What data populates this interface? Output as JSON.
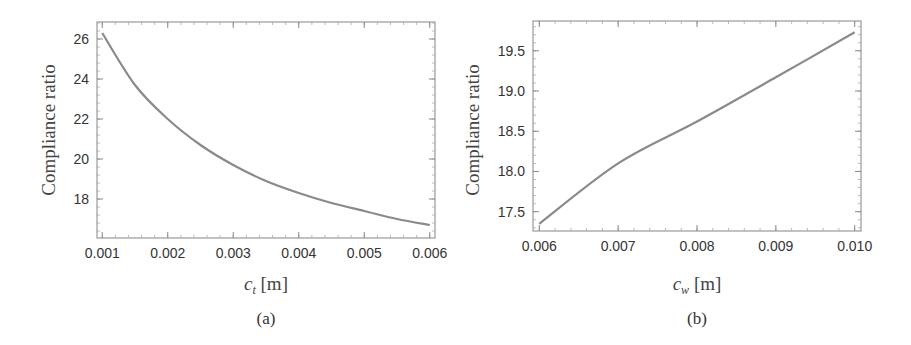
{
  "chart_data": [
    {
      "type": "line",
      "panel": "(a)",
      "title": "",
      "xlabel": "c_t [m]",
      "xlabel_var": "c",
      "xlabel_sub": "t",
      "xlabel_unit": " [m]",
      "ylabel": "Compliance ratio",
      "xlim": [
        0.00092,
        0.00608
      ],
      "ylim": [
        16.05,
        26.85
      ],
      "xticks": [
        "0.001",
        "0.002",
        "0.003",
        "0.004",
        "0.005",
        "0.006"
      ],
      "yticks": [
        "18",
        "20",
        "22",
        "24",
        "26"
      ],
      "grid": false,
      "line_color": "#8a8a8a",
      "x": [
        0.001,
        0.0015,
        0.002,
        0.0025,
        0.003,
        0.0035,
        0.004,
        0.0045,
        0.005,
        0.0055,
        0.006
      ],
      "series": [
        {
          "name": "Compliance ratio",
          "values": [
            26.3,
            23.7,
            22.0,
            20.7,
            19.7,
            18.9,
            18.3,
            17.8,
            17.4,
            17.0,
            16.7
          ]
        }
      ]
    },
    {
      "type": "line",
      "panel": "(b)",
      "title": "",
      "xlabel": "c_w [m]",
      "xlabel_var": "c",
      "xlabel_sub": "w",
      "xlabel_unit": " [m]",
      "ylabel": "Compliance ratio",
      "xlim": [
        0.00592,
        0.01008
      ],
      "ylim": [
        17.26,
        19.87
      ],
      "xticks": [
        "0.006",
        "0.007",
        "0.008",
        "0.009",
        "0.010"
      ],
      "yticks": [
        "17.5",
        "18.0",
        "18.5",
        "19.0",
        "19.5"
      ],
      "grid": false,
      "line_color": "#8a8a8a",
      "x": [
        0.006,
        0.007,
        0.008,
        0.009,
        0.01
      ],
      "series": [
        {
          "name": "Compliance ratio",
          "values": [
            17.35,
            18.1,
            18.62,
            19.17,
            19.73
          ]
        }
      ]
    }
  ],
  "panels": {
    "a": {
      "caption": "(a)",
      "ylabel": "Compliance ratio",
      "xlabel_var": "c",
      "xlabel_sub": "t",
      "xlabel_unit": " [m]"
    },
    "b": {
      "caption": "(b)",
      "ylabel": "Compliance ratio",
      "xlabel_var": "c",
      "xlabel_sub": "w",
      "xlabel_unit": " [m]"
    }
  }
}
